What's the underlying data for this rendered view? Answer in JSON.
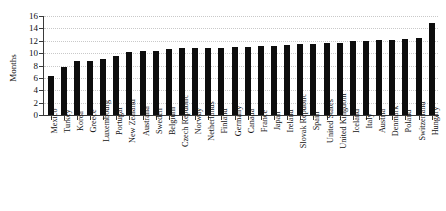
{
  "chart_data": {
    "type": "bar",
    "title": "",
    "xlabel": "",
    "ylabel": "Months",
    "ylim": [
      0,
      16
    ],
    "yticks": [
      0,
      2,
      4,
      6,
      8,
      10,
      12,
      14,
      16
    ],
    "grid": true,
    "legend": null,
    "bar_color": "#0d0d0d",
    "categories": [
      "Mexico",
      "Turkey",
      "Korea",
      "Greece",
      "Luxembourg",
      "Portugal",
      "New Zealand",
      "Australia",
      "Sweden",
      "Belgium",
      "Czech Republic",
      "Norway",
      "Netherlands",
      "Finland",
      "Germany",
      "Canada",
      "France",
      "Japan",
      "Ireland",
      "Slovak Republic",
      "Spain",
      "United States",
      "United Kingdom",
      "Iceland",
      "Italy",
      "Austria",
      "Denmark",
      "Poland",
      "Switzerland",
      "Hungary"
    ],
    "values": [
      6.3,
      7.7,
      8.7,
      8.8,
      9.0,
      9.6,
      10.2,
      10.4,
      10.4,
      10.6,
      10.9,
      10.9,
      10.9,
      10.9,
      11.0,
      11.0,
      11.1,
      11.2,
      11.3,
      11.4,
      11.5,
      11.6,
      11.7,
      11.9,
      12.0,
      12.1,
      12.2,
      12.3,
      12.4,
      14.9
    ]
  }
}
